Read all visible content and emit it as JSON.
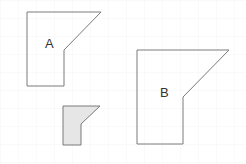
{
  "diagram": {
    "colors": {
      "stroke": "#7a7a7a",
      "shaded_fill": "#e6e6e6",
      "grid": "#f6f6f6",
      "background": "#ffffff"
    },
    "shapes": [
      {
        "id": "A",
        "label": "A",
        "points": "27,12 101,12 64,50 64,86 27,86",
        "fill": "none",
        "label_pos": [
          45,
          48
        ]
      },
      {
        "id": "B",
        "label": "B",
        "points": "137,50 229,50 183,97 183,144 137,144",
        "fill": "none",
        "label_pos": [
          160,
          97
        ]
      },
      {
        "id": "small",
        "label": "",
        "points": "63,106 100,106 81,124 81,145 63,145",
        "fill": "shaded"
      }
    ]
  }
}
